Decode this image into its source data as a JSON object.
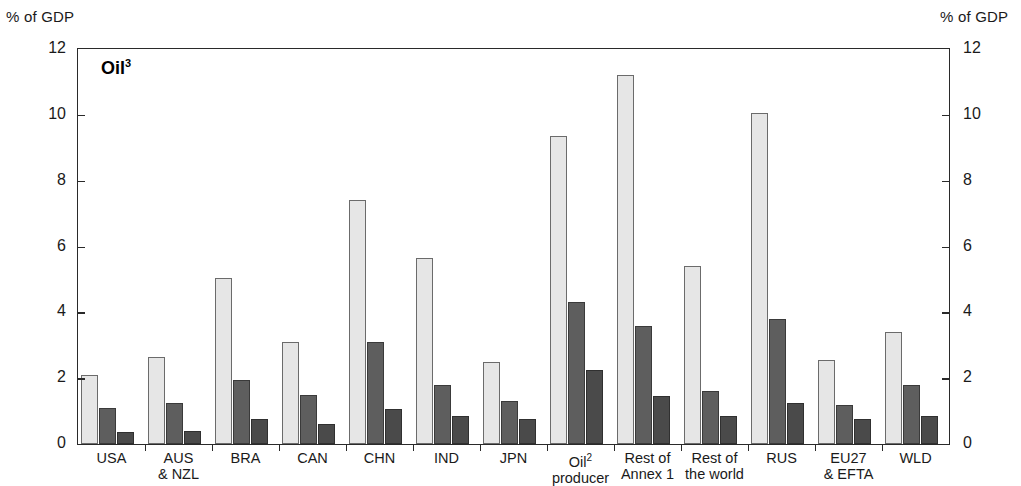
{
  "axes": {
    "unit_label_left": "% of GDP",
    "unit_label_right": "% of GDP",
    "y_ticks": [
      "0",
      "2",
      "4",
      "6",
      "8",
      "10",
      "12"
    ]
  },
  "title": {
    "text": "Oil",
    "footnote": "3"
  },
  "footnotes": {
    "oil_producer": "2"
  },
  "colors": {
    "series_light": "#e6e6e6",
    "series_medium": "#5e5e5e",
    "series_dark": "#4a4a4a",
    "frame": "#2a2a2a",
    "text": "#1a1a1a"
  },
  "chart_data": {
    "type": "bar",
    "title": "Oil3",
    "xlabel": "",
    "ylabel": "% of GDP",
    "ylim": [
      0,
      12
    ],
    "yticks": [
      0,
      2,
      4,
      6,
      8,
      10,
      12
    ],
    "grid": false,
    "legend": "none",
    "categories": [
      "USA",
      "AUS & NZL",
      "BRA",
      "CAN",
      "CHN",
      "IND",
      "JPN",
      "Oil2 producer",
      "Rest of Annex 1",
      "Rest of the world",
      "RUS",
      "EU27 & EFTA",
      "WLD"
    ],
    "category_lines": [
      [
        "USA",
        ""
      ],
      [
        "AUS",
        "& NZL"
      ],
      [
        "BRA",
        ""
      ],
      [
        "CAN",
        ""
      ],
      [
        "CHN",
        ""
      ],
      [
        "IND",
        ""
      ],
      [
        "JPN",
        ""
      ],
      [
        "Oil",
        "producer"
      ],
      [
        "Rest of",
        "Annex 1"
      ],
      [
        "Rest of",
        "the world"
      ],
      [
        "RUS",
        ""
      ],
      [
        "EU27",
        "& EFTA"
      ],
      [
        "WLD",
        ""
      ]
    ],
    "series": [
      {
        "name": "series-1-light",
        "color": "#e6e6e6",
        "values": [
          2.1,
          2.65,
          5.05,
          3.1,
          7.4,
          5.65,
          2.5,
          9.35,
          11.2,
          5.4,
          10.05,
          2.55,
          3.4
        ]
      },
      {
        "name": "series-2-medium",
        "color": "#5e5e5e",
        "values": [
          1.1,
          1.25,
          1.95,
          1.5,
          3.1,
          1.8,
          1.3,
          4.3,
          3.6,
          1.6,
          3.8,
          1.2,
          1.8
        ]
      },
      {
        "name": "series-3-dark",
        "color": "#4a4a4a",
        "values": [
          0.35,
          0.4,
          0.75,
          0.6,
          1.05,
          0.85,
          0.75,
          2.25,
          1.45,
          0.85,
          1.25,
          0.75,
          0.85
        ]
      }
    ]
  }
}
